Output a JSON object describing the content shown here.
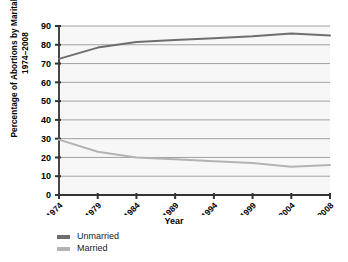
{
  "chart_data": {
    "type": "line",
    "title": "",
    "xlabel": "Year",
    "ylabel": "Percentage of Abortions by Marital Status, 1974–2008",
    "x": [
      1974,
      1979,
      1984,
      1989,
      1994,
      1999,
      2004,
      2008
    ],
    "categories": [
      "1974",
      "1979",
      "1984",
      "1989",
      "1994",
      "1999",
      "2004",
      "2008"
    ],
    "series": [
      {
        "name": "Unmarried",
        "color": "#6e6e6e",
        "values": [
          72.5,
          78.5,
          81.5,
          82.5,
          83.5,
          84.5,
          86.0,
          85.0
        ]
      },
      {
        "name": "Married",
        "color": "#b3b3b3",
        "values": [
          29.5,
          23.0,
          20.0,
          19.0,
          18.0,
          17.0,
          15.0,
          16.0
        ]
      }
    ],
    "ylim": [
      0,
      90
    ],
    "yticks": [
      0,
      10,
      20,
      30,
      40,
      50,
      60,
      70,
      80,
      90
    ],
    "ytick_labels": [
      "0",
      "10",
      "20",
      "30",
      "40",
      "50",
      "60",
      "70",
      "80",
      "90"
    ],
    "grid": true,
    "legend_position": "bottom-left",
    "plot_background": "#f7f7f7",
    "gridline_color": "#8c8c8c",
    "axis_color": "#333333"
  },
  "legend": {
    "items": [
      {
        "label": "Unmarried",
        "color": "#6e6e6e"
      },
      {
        "label": "Married",
        "color": "#b3b3b3"
      }
    ]
  }
}
